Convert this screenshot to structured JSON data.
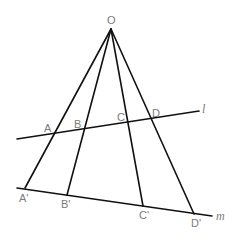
{
  "figure": {
    "apex": {
      "label": "O",
      "x": 111,
      "y": 29,
      "label_x": 107,
      "label_y": 24
    },
    "line_l": {
      "label": "l",
      "x1": 17,
      "y1": 139,
      "x2": 199,
      "y2": 111,
      "label_x": 202,
      "label_y": 113
    },
    "line_m": {
      "label": "m",
      "x1": 17,
      "y1": 188,
      "x2": 212,
      "y2": 216,
      "label_x": 216,
      "label_y": 220
    },
    "points_on_l": [
      {
        "label": "A",
        "x": 55,
        "y": 133,
        "label_x": 44,
        "label_y": 132
      },
      {
        "label": "B",
        "x": 85,
        "y": 128,
        "label_x": 74,
        "label_y": 128
      },
      {
        "label": "C",
        "x": 129,
        "y": 121,
        "label_x": 117,
        "label_y": 121
      },
      {
        "label": "D",
        "x": 152,
        "y": 118,
        "label_x": 152,
        "label_y": 117
      }
    ],
    "points_on_m": [
      {
        "label": "A'",
        "x": 25,
        "y": 188,
        "label_x": 19,
        "label_y": 202
      },
      {
        "label": "B'",
        "x": 67,
        "y": 195,
        "label_x": 61,
        "label_y": 208
      },
      {
        "label": "C'",
        "x": 143,
        "y": 206,
        "label_x": 139,
        "label_y": 219
      },
      {
        "label": "D'",
        "x": 194,
        "y": 214,
        "label_x": 191,
        "label_y": 227
      }
    ]
  }
}
